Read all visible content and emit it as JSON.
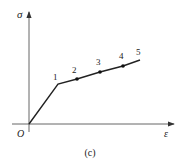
{
  "figure": {
    "caption": "(c)",
    "axes": {
      "y_label": "σ",
      "x_label": "ε",
      "origin_label": "O"
    },
    "points": [
      {
        "label": "1",
        "x": 58,
        "y": 84,
        "marker": false
      },
      {
        "label": "2",
        "x": 77,
        "y": 79,
        "marker": true
      },
      {
        "label": "3",
        "x": 100,
        "y": 72,
        "marker": true
      },
      {
        "label": "4",
        "x": 123,
        "y": 66,
        "marker": true
      },
      {
        "label": "5",
        "x": 140,
        "y": 60,
        "marker": false
      }
    ],
    "colors": {
      "line": "#222222",
      "axis": "#555555"
    }
  }
}
